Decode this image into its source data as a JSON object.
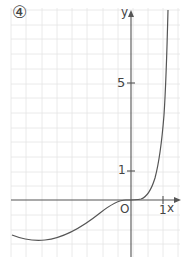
{
  "figure": {
    "panel_label": "④",
    "x_axis_label": "x",
    "y_axis_label": "y",
    "origin_label": "O",
    "x_ticks": [
      {
        "value": 1,
        "label": "1"
      }
    ],
    "y_ticks": [
      {
        "value": 1,
        "label": "1"
      },
      {
        "value": 5,
        "label": "5"
      }
    ],
    "colors": {
      "grid": "#e4e4e4",
      "axis": "#555555",
      "curve": "#555555",
      "background": "#ffffff"
    }
  }
}
